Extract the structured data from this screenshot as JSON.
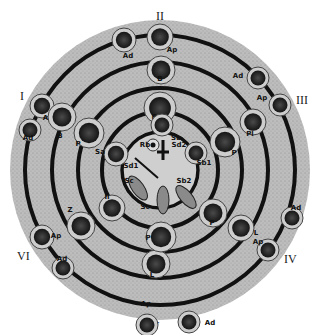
{
  "diagram": {
    "type": "spermatogenic cycle wheel",
    "stage_labels": [
      "I",
      "II",
      "III",
      "IV",
      "V",
      "VI"
    ],
    "colors": {
      "disc": "#b9b9b9",
      "ring": "#111111",
      "cell_rim": "#c9c9c9",
      "cell_core": "#2b2b2b",
      "background": "#ffffff"
    },
    "cells": [
      {
        "label": "Ad",
        "ring": "outer",
        "sector": "II-left"
      },
      {
        "label": "Ap",
        "ring": "outer",
        "sector": "II"
      },
      {
        "label": "Ad",
        "ring": "outer",
        "sector": "III-left"
      },
      {
        "label": "Ap",
        "ring": "outer",
        "sector": "III"
      },
      {
        "label": "Ad",
        "ring": "outer",
        "sector": "IV-up"
      },
      {
        "label": "Ap",
        "ring": "outer",
        "sector": "IV"
      },
      {
        "label": "Ap",
        "ring": "outer",
        "sector": "V"
      },
      {
        "label": "Ad",
        "ring": "outer",
        "sector": "V-right"
      },
      {
        "label": "Ap",
        "ring": "outer",
        "sector": "VI"
      },
      {
        "label": "Ad",
        "ring": "outer",
        "sector": "VI-down"
      },
      {
        "label": "Ap",
        "ring": "outer",
        "sector": "I"
      },
      {
        "label": "Ad",
        "ring": "outer",
        "sector": "I-down"
      },
      {
        "label": "B",
        "ring": "second",
        "sector": "II"
      },
      {
        "label": "B",
        "ring": "second",
        "sector": "I"
      },
      {
        "label": "Pl",
        "ring": "second",
        "sector": "III"
      },
      {
        "label": "L",
        "ring": "second",
        "sector": "IV"
      },
      {
        "label": "L",
        "ring": "second",
        "sector": "V"
      },
      {
        "label": "Z",
        "ring": "second",
        "sector": "VI"
      },
      {
        "label": "P",
        "ring": "third",
        "sector": "II"
      },
      {
        "label": "P",
        "ring": "third",
        "sector": "I"
      },
      {
        "label": "P",
        "ring": "third",
        "sector": "III"
      },
      {
        "label": "P",
        "ring": "third",
        "sector": "IV"
      },
      {
        "label": "P",
        "ring": "third",
        "sector": "V"
      },
      {
        "label": "II",
        "ring": "third",
        "sector": "VI"
      },
      {
        "label": "Sa",
        "ring": "inner",
        "sector": "II"
      },
      {
        "label": "Sa",
        "ring": "inner",
        "sector": "I"
      },
      {
        "label": "Sb1",
        "ring": "inner",
        "sector": "III"
      },
      {
        "label": "Rb",
        "ring": "center",
        "sector": "center"
      },
      {
        "label": "Sd2",
        "ring": "center",
        "sector": "center"
      },
      {
        "label": "Sd1",
        "ring": "center",
        "sector": "center"
      },
      {
        "label": "Sc",
        "ring": "center",
        "sector": "center"
      },
      {
        "label": "Sc",
        "ring": "center",
        "sector": "center"
      },
      {
        "label": "Sb2",
        "ring": "center",
        "sector": "center"
      }
    ]
  }
}
